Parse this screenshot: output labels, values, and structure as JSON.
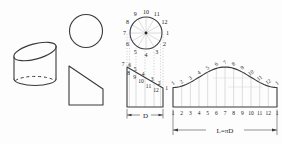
{
  "divided_circle": {
    "labels_clockwise_from_top": [
      "10",
      "11",
      "12",
      "1",
      "2",
      "3",
      "4",
      "5",
      "6",
      "7",
      "8",
      "9"
    ]
  },
  "front_view": {
    "upper_labels": [
      "7",
      "6",
      "5",
      "4",
      "3",
      "2",
      "1"
    ],
    "lower_labels": [
      "8",
      "9",
      "10",
      "11",
      "12"
    ],
    "dim_label": "D"
  },
  "development": {
    "top_labels": [
      "1",
      "2",
      "3",
      "4",
      "5",
      "6",
      "7",
      "8",
      "9",
      "10",
      "11",
      "12",
      "1"
    ],
    "bottom_labels": [
      "1",
      "2",
      "3",
      "4",
      "5",
      "6",
      "7",
      "8",
      "9",
      "10",
      "11",
      "12",
      "1"
    ],
    "dim_label": "L=πD"
  }
}
